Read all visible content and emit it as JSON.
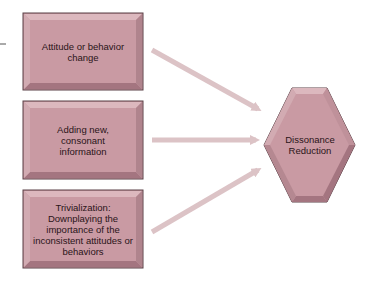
{
  "diagram": {
    "sources": [
      {
        "label": "Attitude or behavior change"
      },
      {
        "label": "Adding new, consonant information"
      },
      {
        "label": "Trivialization: Downplaying the importance of the inconsistent attitudes or behaviors"
      }
    ],
    "target": {
      "label": "Dissonance Reduction"
    },
    "colors": {
      "box_fill": "#c99aa3",
      "box_bevel_light": "#dcb8be",
      "box_bevel_dark": "#a47580",
      "box_border": "#5a4046",
      "arrow": "#dcc3c6"
    }
  }
}
